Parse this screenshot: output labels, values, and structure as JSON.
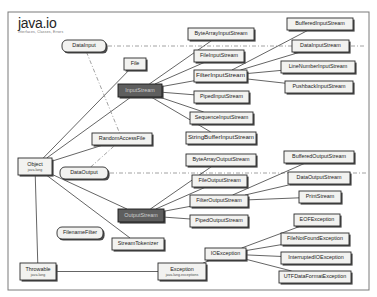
{
  "diagram": {
    "title": "java.io",
    "subtitle": "Interfaces, Classes, Errors",
    "width": 377,
    "height": 297,
    "frame": {
      "x": 8,
      "y": 12,
      "width": 361,
      "height": 278
    },
    "colors": {
      "background": "#ffffff",
      "node_fill": "#f2f2f0",
      "node_stroke": "#2b2b2b",
      "highlight_fill": "#5e5e5e",
      "highlight_text": "#cfcfcf",
      "shadow": "#4a4a4a",
      "edge_solid": "#3d3d3d",
      "edge_dashed": "#8a8a8a",
      "frame_stroke": "#7a7a7a"
    },
    "legend": {
      "solid_edge_meaning": "extends",
      "dashdot_edge_meaning": "implements"
    },
    "nodes": [
      {
        "id": "datainput",
        "label": "DataInput",
        "sublabel": "",
        "x": 62,
        "y": 40,
        "w": 44,
        "h": 12,
        "shape": "interface",
        "style": "normal"
      },
      {
        "id": "file",
        "label": "File",
        "sublabel": "",
        "x": 124,
        "y": 58,
        "w": 22,
        "h": 12,
        "shape": "class",
        "style": "normal"
      },
      {
        "id": "inputstream",
        "label": "InputStream",
        "sublabel": "",
        "x": 118,
        "y": 84,
        "w": 44,
        "h": 13,
        "shape": "class",
        "style": "highlight"
      },
      {
        "id": "randomaccessfile",
        "label": "RandomAccessFile",
        "sublabel": "",
        "x": 92,
        "y": 133,
        "w": 60,
        "h": 12,
        "shape": "class",
        "style": "normal"
      },
      {
        "id": "dataoutput",
        "label": "DataOutput",
        "sublabel": "",
        "x": 60,
        "y": 167,
        "w": 48,
        "h": 12,
        "shape": "interface",
        "style": "normal"
      },
      {
        "id": "object",
        "label": "Object",
        "sublabel": "java.lang",
        "x": 18,
        "y": 158,
        "w": 34,
        "h": 17,
        "shape": "class",
        "style": "normal"
      },
      {
        "id": "outputstream",
        "label": "OutputStream",
        "sublabel": "",
        "x": 118,
        "y": 209,
        "w": 46,
        "h": 13,
        "shape": "class",
        "style": "highlight"
      },
      {
        "id": "filenamefilter",
        "label": "FilenameFilter",
        "sublabel": "",
        "x": 57,
        "y": 227,
        "w": 46,
        "h": 12,
        "shape": "interface",
        "style": "normal"
      },
      {
        "id": "streamtokenizer",
        "label": "StreamTokenizer",
        "sublabel": "",
        "x": 112,
        "y": 238,
        "w": 52,
        "h": 12,
        "shape": "class",
        "style": "normal"
      },
      {
        "id": "throwable",
        "label": "Throwable",
        "sublabel": "java.lang",
        "x": 20,
        "y": 263,
        "w": 36,
        "h": 17,
        "shape": "class",
        "style": "normal"
      },
      {
        "id": "exception",
        "label": "Exception",
        "sublabel": "java.lang.exceptions",
        "x": 158,
        "y": 263,
        "w": 48,
        "h": 17,
        "shape": "class",
        "style": "normal"
      },
      {
        "id": "bytearrayinputstream",
        "label": "ByteArrayInputStream",
        "sublabel": "",
        "x": 188,
        "y": 28,
        "w": 66,
        "h": 12,
        "shape": "class",
        "style": "normal"
      },
      {
        "id": "fileinputstream",
        "label": "FileInputStream",
        "sublabel": "",
        "x": 194,
        "y": 50,
        "w": 50,
        "h": 12,
        "shape": "class",
        "style": "normal"
      },
      {
        "id": "filterinputstream",
        "label": "FilterInputStream",
        "sublabel": "",
        "x": 194,
        "y": 70,
        "w": 53,
        "h": 12,
        "shape": "class",
        "style": "normal"
      },
      {
        "id": "pipedinputstream",
        "label": "PipedInputStream",
        "sublabel": "",
        "x": 194,
        "y": 91,
        "w": 55,
        "h": 12,
        "shape": "class",
        "style": "normal"
      },
      {
        "id": "sequenceinputstream",
        "label": "SequenceInputStream",
        "sublabel": "",
        "x": 190,
        "y": 112,
        "w": 63,
        "h": 12,
        "shape": "class",
        "style": "normal"
      },
      {
        "id": "stringbufferinputstream",
        "label": "StringBufferInputStream",
        "sublabel": "",
        "x": 186,
        "y": 132,
        "w": 70,
        "h": 12,
        "shape": "class",
        "style": "normal"
      },
      {
        "id": "bufferedinputstream",
        "label": "BufferedInputStream",
        "sublabel": "",
        "x": 287,
        "y": 18,
        "w": 66,
        "h": 12,
        "shape": "class",
        "style": "normal"
      },
      {
        "id": "datainputstream",
        "label": "DataInputStream",
        "sublabel": "",
        "x": 292,
        "y": 40,
        "w": 57,
        "h": 12,
        "shape": "class",
        "style": "normal"
      },
      {
        "id": "linenumberinputstream",
        "label": "LineNumberInputStream",
        "sublabel": "",
        "x": 281,
        "y": 61,
        "w": 74,
        "h": 12,
        "shape": "class",
        "style": "normal"
      },
      {
        "id": "pushbackinputstream",
        "label": "PushbackInputStream",
        "sublabel": "",
        "x": 285,
        "y": 81,
        "w": 68,
        "h": 12,
        "shape": "class",
        "style": "normal"
      },
      {
        "id": "bytearrayoutputstream",
        "label": "ByteArrayOutputStream",
        "sublabel": "",
        "x": 186,
        "y": 154,
        "w": 70,
        "h": 12,
        "shape": "class",
        "style": "normal"
      },
      {
        "id": "fileoutputstream",
        "label": "FileOutputStream",
        "sublabel": "",
        "x": 192,
        "y": 175,
        "w": 55,
        "h": 12,
        "shape": "class",
        "style": "normal"
      },
      {
        "id": "filteroutputstream",
        "label": "FilterOutputStream",
        "sublabel": "",
        "x": 190,
        "y": 195,
        "w": 58,
        "h": 12,
        "shape": "class",
        "style": "normal"
      },
      {
        "id": "pipedoutputstream",
        "label": "PipedOutputStream",
        "sublabel": "",
        "x": 190,
        "y": 215,
        "w": 58,
        "h": 12,
        "shape": "class",
        "style": "normal"
      },
      {
        "id": "bufferedoutputstream",
        "label": "BufferedOutputStream",
        "sublabel": "",
        "x": 284,
        "y": 151,
        "w": 70,
        "h": 12,
        "shape": "class",
        "style": "normal"
      },
      {
        "id": "dataoutputstream",
        "label": "DataOutputStream",
        "sublabel": "",
        "x": 288,
        "y": 172,
        "w": 62,
        "h": 12,
        "shape": "class",
        "style": "normal"
      },
      {
        "id": "printstream",
        "label": "PrintStream",
        "sublabel": "",
        "x": 299,
        "y": 191,
        "w": 42,
        "h": 12,
        "shape": "class",
        "style": "normal"
      },
      {
        "id": "ioexception",
        "label": "IOException",
        "sublabel": "",
        "x": 205,
        "y": 248,
        "w": 41,
        "h": 12,
        "shape": "class",
        "style": "normal"
      },
      {
        "id": "eofexception",
        "label": "EOFException",
        "sublabel": "",
        "x": 294,
        "y": 214,
        "w": 46,
        "h": 12,
        "shape": "class",
        "style": "normal"
      },
      {
        "id": "filenotfoundexception",
        "label": "FileNotFoundException",
        "sublabel": "",
        "x": 281,
        "y": 233,
        "w": 68,
        "h": 12,
        "shape": "class",
        "style": "normal"
      },
      {
        "id": "interruptedioexception",
        "label": "InterruptedIOException",
        "sublabel": "",
        "x": 281,
        "y": 252,
        "w": 70,
        "h": 12,
        "shape": "class",
        "style": "normal"
      },
      {
        "id": "utfdataformatexception",
        "label": "UTFDataFormatException",
        "sublabel": "",
        "x": 279,
        "y": 271,
        "w": 72,
        "h": 12,
        "shape": "class",
        "style": "normal"
      }
    ],
    "edges": [
      {
        "from": "object",
        "to": "file",
        "type": "extends"
      },
      {
        "from": "object",
        "to": "inputstream",
        "type": "extends"
      },
      {
        "from": "object",
        "to": "randomaccessfile",
        "type": "extends"
      },
      {
        "from": "object",
        "to": "outputstream",
        "type": "extends"
      },
      {
        "from": "object",
        "to": "streamtokenizer",
        "type": "extends"
      },
      {
        "from": "object",
        "to": "throwable",
        "type": "extends"
      },
      {
        "from": "inputstream",
        "to": "bytearrayinputstream",
        "type": "extends"
      },
      {
        "from": "inputstream",
        "to": "fileinputstream",
        "type": "extends"
      },
      {
        "from": "inputstream",
        "to": "filterinputstream",
        "type": "extends"
      },
      {
        "from": "inputstream",
        "to": "pipedinputstream",
        "type": "extends"
      },
      {
        "from": "inputstream",
        "to": "sequenceinputstream",
        "type": "extends"
      },
      {
        "from": "inputstream",
        "to": "stringbufferinputstream",
        "type": "extends"
      },
      {
        "from": "filterinputstream",
        "to": "bufferedinputstream",
        "type": "extends"
      },
      {
        "from": "filterinputstream",
        "to": "datainputstream",
        "type": "extends"
      },
      {
        "from": "filterinputstream",
        "to": "linenumberinputstream",
        "type": "extends"
      },
      {
        "from": "filterinputstream",
        "to": "pushbackinputstream",
        "type": "extends"
      },
      {
        "from": "outputstream",
        "to": "bytearrayoutputstream",
        "type": "extends"
      },
      {
        "from": "outputstream",
        "to": "fileoutputstream",
        "type": "extends"
      },
      {
        "from": "outputstream",
        "to": "filteroutputstream",
        "type": "extends"
      },
      {
        "from": "outputstream",
        "to": "pipedoutputstream",
        "type": "extends"
      },
      {
        "from": "filteroutputstream",
        "to": "bufferedoutputstream",
        "type": "extends"
      },
      {
        "from": "filteroutputstream",
        "to": "dataoutputstream",
        "type": "extends"
      },
      {
        "from": "filteroutputstream",
        "to": "printstream",
        "type": "extends"
      },
      {
        "from": "throwable",
        "to": "exception",
        "type": "extends"
      },
      {
        "from": "exception",
        "to": "ioexception",
        "type": "extends"
      },
      {
        "from": "ioexception",
        "to": "eofexception",
        "type": "extends"
      },
      {
        "from": "ioexception",
        "to": "filenotfoundexception",
        "type": "extends"
      },
      {
        "from": "ioexception",
        "to": "interruptedioexception",
        "type": "extends"
      },
      {
        "from": "ioexception",
        "to": "utfdataformatexception",
        "type": "extends"
      },
      {
        "from": "datainput",
        "to": "randomaccessfile",
        "type": "implements"
      },
      {
        "from": "dataoutput",
        "to": "randomaccessfile",
        "type": "implements"
      }
    ],
    "guide_lines": [
      {
        "id": "datainput-guide",
        "x1": 108,
        "y1": 46,
        "x2": 366,
        "y2": 46,
        "type": "implements"
      },
      {
        "id": "dataoutput-guide",
        "x1": 110,
        "y1": 173,
        "x2": 366,
        "y2": 173,
        "type": "implements"
      }
    ]
  }
}
